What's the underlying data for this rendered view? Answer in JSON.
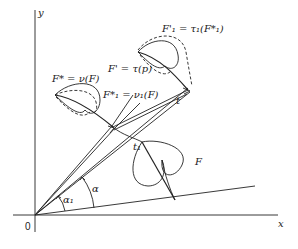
{
  "figure": {
    "type": "geometric transformation diagram",
    "axes": {
      "x_label": "x",
      "y_label": "y",
      "origin_label": "0"
    },
    "labels": {
      "F": "F",
      "F_star": "F* = ν(F)",
      "F1_star": "F*₁ = ν₁(F)",
      "F_prime": "F' = τ(p)",
      "F1_prime": "F'₁ = τ₁(F*₁)",
      "t": "t",
      "t1": "t₁",
      "alpha": "α",
      "alpha1": "α₁"
    },
    "colors": {
      "stroke": "#222222",
      "background": "#ffffff"
    }
  }
}
